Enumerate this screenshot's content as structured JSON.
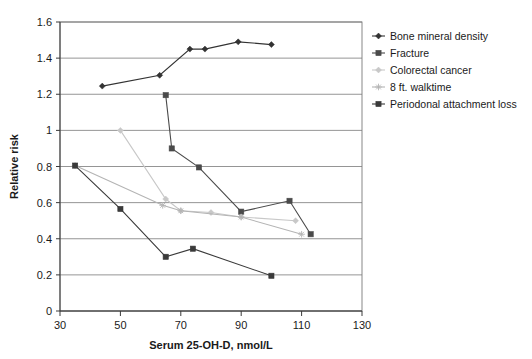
{
  "chart_data": {
    "type": "line",
    "title": "",
    "xlabel": "Serum 25-OH-D, nmol/L",
    "ylabel": "Relative risk",
    "xlim": [
      30,
      130
    ],
    "ylim": [
      0,
      1.6
    ],
    "xticks": [
      30,
      50,
      70,
      90,
      110,
      130
    ],
    "yticks": [
      0,
      0.2,
      0.4,
      0.6,
      0.8,
      1,
      1.2,
      1.4,
      1.6
    ],
    "xtick_labels": [
      "30",
      "50",
      "70",
      "90",
      "110",
      "130"
    ],
    "ytick_labels": [
      "0",
      "0.2",
      "0.4",
      "0.6",
      "0.8",
      "1",
      "1.2",
      "1.4",
      "1.6"
    ],
    "grid": "horizontal",
    "legend_position": "right",
    "series": [
      {
        "name": "Bone mineral density",
        "color": "#333333",
        "marker": "diamond",
        "x": [
          44,
          63,
          73,
          78,
          89,
          100
        ],
        "y": [
          1.245,
          1.305,
          1.45,
          1.45,
          1.49,
          1.475
        ]
      },
      {
        "name": "Fracture",
        "color": "#4a4a4a",
        "marker": "square",
        "x": [
          65,
          67,
          76,
          90,
          106,
          113
        ],
        "y": [
          1.195,
          0.9,
          0.795,
          0.55,
          0.61,
          0.425
        ]
      },
      {
        "name": "Colorectal cancer",
        "color": "#c8c8c8",
        "marker": "diamond",
        "x": [
          50,
          65,
          70,
          80,
          90,
          108
        ],
        "y": [
          1.0,
          0.62,
          0.555,
          0.545,
          0.52,
          0.5
        ]
      },
      {
        "name": "8 ft. walktime",
        "color": "#b4b4b4",
        "marker": "star",
        "x": [
          35,
          64,
          70,
          90,
          110
        ],
        "y": [
          0.805,
          0.585,
          0.555,
          0.52,
          0.425
        ]
      },
      {
        "name": "Periodonal attachment loss",
        "color": "#3a3a3a",
        "marker": "square",
        "x": [
          35,
          50,
          65,
          74,
          100
        ],
        "y": [
          0.805,
          0.565,
          0.3,
          0.345,
          0.195
        ]
      }
    ]
  },
  "legend": {
    "items": [
      {
        "label": "Bone mineral density"
      },
      {
        "label": "Fracture"
      },
      {
        "label": "Colorectal cancer"
      },
      {
        "label": "8 ft. walktime"
      },
      {
        "label": "Periodonal attachment loss"
      }
    ]
  }
}
